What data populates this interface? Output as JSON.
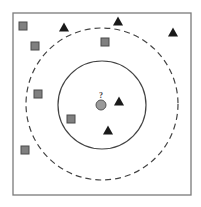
{
  "diagram": {
    "frame": {
      "x": 13,
      "y": 13,
      "width": 178,
      "height": 182,
      "stroke": "#7a7a7a"
    },
    "query_point": {
      "label": "?",
      "cx": 101,
      "cy": 105,
      "r": 5,
      "fill": "#9a9a9a",
      "stroke": "#555555"
    },
    "inner_circle": {
      "cx": 102,
      "cy": 105,
      "r": 44,
      "style": "solid",
      "stroke": "#444444",
      "meaning": "k=3 neighborhood"
    },
    "outer_circle": {
      "cx": 102,
      "cy": 104,
      "r": 76,
      "style": "dashed",
      "stroke": "#444444",
      "meaning": "k=5 neighborhood"
    },
    "class_square": {
      "name": "square",
      "fill": "#808080",
      "stroke": "#4a4a4a",
      "size": 8
    },
    "class_triangle": {
      "name": "triangle",
      "fill": "#1a1a1a",
      "size": 10
    },
    "squares": [
      {
        "x": 23,
        "y": 26
      },
      {
        "x": 35,
        "y": 46
      },
      {
        "x": 105,
        "y": 42
      },
      {
        "x": 38,
        "y": 94
      },
      {
        "x": 71,
        "y": 119
      },
      {
        "x": 25,
        "y": 150
      }
    ],
    "triangles": [
      {
        "x": 64,
        "y": 27
      },
      {
        "x": 118,
        "y": 21
      },
      {
        "x": 173,
        "y": 32
      },
      {
        "x": 119,
        "y": 101
      },
      {
        "x": 108,
        "y": 130
      }
    ]
  }
}
